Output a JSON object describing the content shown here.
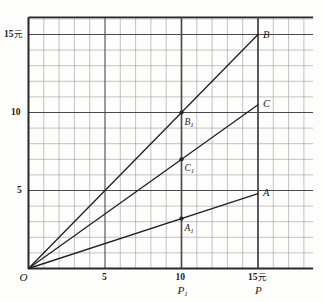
{
  "chart_data": {
    "type": "line",
    "title": "",
    "xlabel": "P",
    "ylabel": "",
    "xlim": [
      0,
      18.6
    ],
    "ylim": [
      0,
      16.1
    ],
    "grid": true,
    "grid_minor_step": 1,
    "grid_major_step": 5,
    "legend_position": "inline-end-labels",
    "x_ticks": [
      {
        "value": 0,
        "label": "O"
      },
      {
        "value": 5,
        "label": "5"
      },
      {
        "value": 10,
        "label": "10"
      },
      {
        "value": 15,
        "label": "15",
        "unit": "元"
      }
    ],
    "y_ticks": [
      {
        "value": 5,
        "label": "5"
      },
      {
        "value": 10,
        "label": "10"
      },
      {
        "value": 15,
        "label": "15",
        "unit": "元"
      }
    ],
    "axis_annotations": [
      {
        "name": "P1",
        "label": "P",
        "sub": "1",
        "x": 10
      },
      {
        "name": "P",
        "label": "P",
        "sub": "",
        "x": 15
      }
    ],
    "series": [
      {
        "name": "B",
        "label": "B",
        "slope": 1.0,
        "x_end": 15,
        "y_end": 15.0
      },
      {
        "name": "C",
        "label": "C",
        "slope": 0.7,
        "x_end": 15,
        "y_end": 10.5
      },
      {
        "name": "A",
        "label": "A",
        "slope": 0.32,
        "x_end": 15,
        "y_end": 4.8
      }
    ],
    "marked_points": [
      {
        "name": "B1",
        "label": "B",
        "sub": "1",
        "x": 10,
        "y": 10.0
      },
      {
        "name": "C1",
        "label": "C",
        "sub": "1",
        "x": 10,
        "y": 7.0
      },
      {
        "name": "A1",
        "label": "A",
        "sub": "1",
        "x": 10,
        "y": 3.2
      }
    ],
    "vertical_markers": [
      10,
      15
    ],
    "origin_label": "O"
  },
  "colors": {
    "background": "#fdfdfc",
    "grid_minor": "#9a9a9a",
    "grid_major": "#4a4a4a",
    "axis": "#2a2a2a",
    "line": "#232323",
    "text": "#1a1a1a"
  }
}
